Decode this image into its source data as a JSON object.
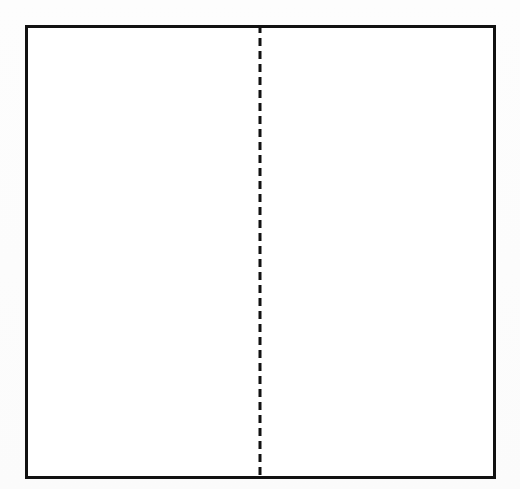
{
  "figure": {
    "title": "",
    "caption": "",
    "background_color": "#fdfdfd",
    "width": 520,
    "height": 489
  },
  "shapes": {
    "outer_rectangle": {
      "name": "outer-rectangle",
      "label": "",
      "shape": "rectangle",
      "x": 25,
      "y": 25,
      "width": 471,
      "height": 454,
      "stroke_color": "#111111",
      "stroke_width": 3,
      "fill_color": "#ffffff"
    },
    "divider_line": {
      "name": "vertical-dashed-divider",
      "label": "",
      "shape": "line",
      "orientation": "vertical",
      "x": 261,
      "y_start": 25,
      "y_end": 480,
      "stroke_color": "#111111",
      "stroke_width": 3,
      "dash_length": 8,
      "gap_length": 5,
      "style": "dashed"
    }
  },
  "regions": [
    {
      "name": "left-region",
      "label": ""
    },
    {
      "name": "right-region",
      "label": ""
    }
  ],
  "annotations": [],
  "text_labels": []
}
